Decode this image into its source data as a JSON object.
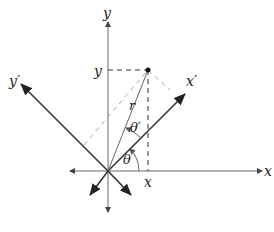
{
  "diagram": {
    "labels": {
      "y_axis": "y",
      "x_axis": "x",
      "y_prime": "y′",
      "x_prime": "x′",
      "y_coord": "y",
      "x_coord": "x",
      "radius": "r",
      "theta": "θ",
      "theta_prime": "θ′"
    },
    "colors": {
      "axis": "#555555",
      "rotated_axis": "#333333",
      "projection_dashed": "#333333",
      "rotated_projection_dashed": "#aaaaaa",
      "point": "#111111"
    },
    "points": {
      "origin": [
        108,
        171
      ],
      "P": [
        148,
        70
      ]
    }
  }
}
